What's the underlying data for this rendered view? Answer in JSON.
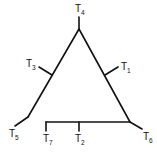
{
  "diagram": {
    "type": "tree",
    "line_color": "#111111",
    "background": "#ffffff",
    "nodes": {
      "apex": {
        "x": 79,
        "y": 29
      },
      "left_bottom": {
        "x": 28,
        "y": 117
      },
      "right_bottom": {
        "x": 130,
        "y": 122
      },
      "t3_join": {
        "x": 52,
        "y": 75
      },
      "t1_join": {
        "x": 105,
        "y": 75
      },
      "bottom_left_end": {
        "x": 46,
        "y": 122
      },
      "t2_join": {
        "x": 79,
        "y": 122
      }
    },
    "leaves": [
      {
        "id": "T1",
        "base": "T",
        "sub": "1",
        "x1": 105,
        "y1": 75,
        "x2": 118,
        "y2": 67,
        "label_x": 121,
        "label_y": 70
      },
      {
        "id": "T2",
        "base": "T",
        "sub": "2",
        "x1": 79,
        "y1": 122,
        "x2": 79,
        "y2": 131,
        "label_x": 75,
        "label_y": 142
      },
      {
        "id": "T3",
        "base": "T",
        "sub": "3",
        "x1": 52,
        "y1": 75,
        "x2": 39,
        "y2": 67,
        "label_x": 26,
        "label_y": 67
      },
      {
        "id": "T4",
        "base": "T",
        "sub": "4",
        "x1": 79,
        "y1": 29,
        "x2": 79,
        "y2": 17,
        "label_x": 75,
        "label_y": 12
      },
      {
        "id": "T5",
        "base": "T",
        "sub": "5",
        "x1": 28,
        "y1": 117,
        "x2": 15,
        "y2": 126,
        "label_x": 9,
        "label_y": 137
      },
      {
        "id": "T6",
        "base": "T",
        "sub": "6",
        "x1": 130,
        "y1": 122,
        "x2": 142,
        "y2": 129,
        "label_x": 143,
        "label_y": 140
      },
      {
        "id": "T7",
        "base": "T",
        "sub": "7",
        "x1": 46,
        "y1": 122,
        "x2": 46,
        "y2": 131,
        "label_x": 43,
        "label_y": 142
      }
    ],
    "internal_edges": [
      {
        "x1": 79,
        "y1": 29,
        "x2": 28,
        "y2": 117
      },
      {
        "x1": 79,
        "y1": 29,
        "x2": 130,
        "y2": 122
      },
      {
        "x1": 46,
        "y1": 122,
        "x2": 130,
        "y2": 122
      }
    ]
  }
}
